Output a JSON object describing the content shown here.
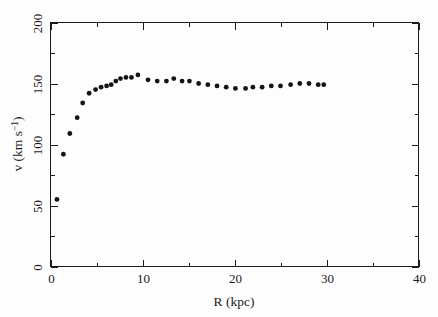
{
  "chart_data": {
    "type": "scatter",
    "title": "",
    "subtitle": "",
    "xlabel": "R (kpc)",
    "ylabel": "v (km s⁻¹)",
    "ylabel_parts": {
      "symbol": "v",
      "unit_open": " (km s",
      "exponent": "−1",
      "unit_close": ")"
    },
    "xlim": [
      0,
      40
    ],
    "ylim": [
      0,
      200
    ],
    "x_ticks": [
      0,
      10,
      20,
      30,
      40
    ],
    "x_tick_labels": [
      "0",
      "10",
      "20",
      "30",
      "40"
    ],
    "x_minor_ticks": [
      5,
      15,
      25,
      35
    ],
    "y_ticks": [
      0,
      50,
      100,
      150,
      200
    ],
    "y_tick_labels": [
      "0",
      "50",
      "100",
      "150",
      "200"
    ],
    "y_minor_ticks": [
      25,
      75,
      125,
      175
    ],
    "grid": false,
    "legend": null,
    "legend_position": "none",
    "marker": "filled-circle",
    "marker_color": "#141414",
    "marker_size": 2.4,
    "series": [
      {
        "name": "rotation curve",
        "points": [
          [
            0.7,
            55
          ],
          [
            1.4,
            92
          ],
          [
            2.1,
            109
          ],
          [
            2.9,
            122
          ],
          [
            3.5,
            134
          ],
          [
            4.2,
            142
          ],
          [
            4.9,
            145
          ],
          [
            5.5,
            147
          ],
          [
            6.1,
            148
          ],
          [
            6.6,
            149
          ],
          [
            7.1,
            152
          ],
          [
            7.6,
            154
          ],
          [
            8.2,
            155
          ],
          [
            8.8,
            155
          ],
          [
            9.5,
            157
          ],
          [
            10.6,
            153
          ],
          [
            11.6,
            152
          ],
          [
            12.6,
            152
          ],
          [
            13.4,
            154
          ],
          [
            14.3,
            152
          ],
          [
            15.1,
            152
          ],
          [
            16.1,
            150
          ],
          [
            17.1,
            149
          ],
          [
            18.1,
            148
          ],
          [
            19.1,
            147
          ],
          [
            20.1,
            146
          ],
          [
            21.2,
            146
          ],
          [
            22.0,
            147
          ],
          [
            23.0,
            147
          ],
          [
            24.0,
            148
          ],
          [
            25.0,
            148
          ],
          [
            26.1,
            149
          ],
          [
            27.1,
            150
          ],
          [
            28.1,
            150
          ],
          [
            29.1,
            149
          ],
          [
            29.7,
            149
          ]
        ]
      }
    ]
  },
  "figure": {
    "background_color": "#fdfdfd",
    "axis_color": "#1a1a1a",
    "marker_color": "#141414"
  }
}
